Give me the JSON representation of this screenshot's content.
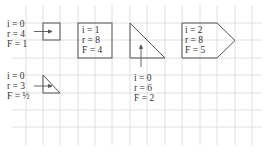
{
  "diagram": {
    "grid": {
      "x_lines": [
        26,
        43,
        60,
        78,
        95,
        112,
        130,
        147,
        165,
        182,
        200,
        217,
        235,
        252
      ],
      "y_lines": [
        5,
        23,
        40,
        58,
        75,
        93,
        110,
        127
      ],
      "y_top": 5,
      "y_bottom": 145,
      "x_left": 12,
      "x_right": 262,
      "color": "#d8d8d8"
    },
    "shape_color": "#555555",
    "shapes": [
      {
        "id": "unit-square",
        "type": "square",
        "labels": {
          "i": "i = 0",
          "r": "r = 4",
          "F": "F = 1"
        },
        "label_pos": {
          "x": 7,
          "y": 19
        },
        "label_placement": "left-external"
      },
      {
        "id": "big-square",
        "type": "square",
        "labels": {
          "i": "i = 1",
          "r": "r = 8",
          "F": "F = 4"
        },
        "label_pos": {
          "x": 82,
          "y": 25
        },
        "label_placement": "inside"
      },
      {
        "id": "big-triangle",
        "type": "right-triangle",
        "labels": {
          "i": "i = 0",
          "r": "r = 6",
          "F": "F = 2"
        },
        "label_pos": {
          "x": 134,
          "y": 73
        },
        "label_placement": "below-external"
      },
      {
        "id": "pentagon",
        "type": "pentagon-arrow",
        "labels": {
          "i": "i = 2",
          "r": "r = 8",
          "F": "F = 5"
        },
        "label_pos": {
          "x": 182,
          "y": 25
        },
        "label_placement": "inside"
      },
      {
        "id": "small-triangle",
        "type": "right-triangle",
        "labels": {
          "i": "i = 0",
          "r": "r = 3",
          "F": "F = ½"
        },
        "label_pos": {
          "x": 7,
          "y": 71
        },
        "label_placement": "left-external"
      }
    ]
  }
}
